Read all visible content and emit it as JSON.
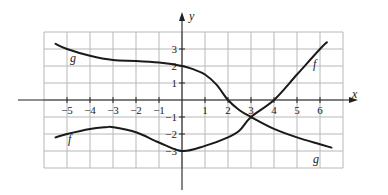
{
  "chart_data": {
    "type": "line",
    "title": "",
    "xlabel": "x",
    "ylabel": "y",
    "xlim": [
      -6,
      7
    ],
    "ylim": [
      -4,
      4
    ],
    "grid": true,
    "x_ticks": [
      "-5",
      "-4",
      "-3",
      "-2",
      "-1",
      "1",
      "2",
      "3",
      "4",
      "5",
      "6"
    ],
    "x_tick_values": [
      -5,
      -4,
      -3,
      -2,
      -1,
      1,
      2,
      3,
      4,
      5,
      6
    ],
    "y_ticks": [
      "3",
      "2",
      "1",
      "-1",
      "-2",
      "-3"
    ],
    "y_tick_values": [
      3,
      2,
      1,
      -1,
      -2,
      -3
    ],
    "series": [
      {
        "name": "f",
        "points": [
          [
            -5.5,
            -2.2
          ],
          [
            -5,
            -2.0
          ],
          [
            -4,
            -1.7
          ],
          [
            -3.3,
            -1.6
          ],
          [
            -3,
            -1.6
          ],
          [
            -2,
            -1.9
          ],
          [
            -1,
            -2.5
          ],
          [
            0,
            -3.0
          ],
          [
            1,
            -2.7
          ],
          [
            2,
            -2.2
          ],
          [
            2.5,
            -1.8
          ],
          [
            3,
            -1.0
          ],
          [
            4,
            0.0
          ],
          [
            5,
            1.5
          ],
          [
            6,
            3.0
          ],
          [
            6.3,
            3.4
          ]
        ],
        "label_pos": [
          -5,
          -2.8
        ]
      },
      {
        "name": "g",
        "points": [
          [
            -5.5,
            3.3
          ],
          [
            -5,
            3.0
          ],
          [
            -4,
            2.6
          ],
          [
            -3,
            2.35
          ],
          [
            -2,
            2.3
          ],
          [
            -1,
            2.2
          ],
          [
            0,
            2.0
          ],
          [
            0.5,
            1.8
          ],
          [
            1,
            1.5
          ],
          [
            1.5,
            0.9
          ],
          [
            2,
            0.0
          ],
          [
            2.5,
            -0.6
          ],
          [
            3,
            -1.0
          ],
          [
            4,
            -1.7
          ],
          [
            5,
            -2.2
          ],
          [
            6,
            -2.6
          ],
          [
            6.5,
            -2.8
          ]
        ],
        "label_pos": [
          6,
          -3.6
        ]
      }
    ]
  },
  "labels": {
    "x_axis": "x",
    "y_axis": "y",
    "f_top": "f",
    "f_bottom": "f",
    "g_top": "g",
    "g_bottom": "g"
  }
}
